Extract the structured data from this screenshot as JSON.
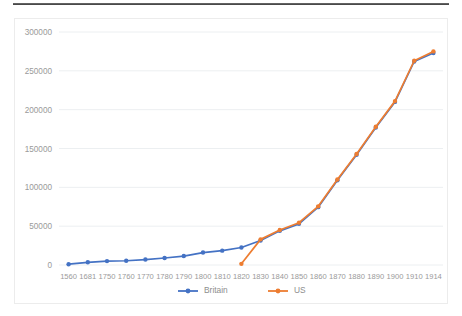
{
  "chart": {
    "title": "",
    "axis_color": "#9a9a9a",
    "grid_color": "#eceff1",
    "border_color": "#ececec"
  },
  "legend": {
    "position": "bottom",
    "entries": [
      {
        "label": "Britain",
        "color": "#4472C4",
        "marker": "circle"
      },
      {
        "label": "US",
        "color": "#ED7D31",
        "marker": "circle"
      }
    ]
  },
  "chart_data": {
    "type": "line",
    "title": "",
    "xlabel": "",
    "ylabel": "",
    "ylim": [
      0,
      300000
    ],
    "grid": true,
    "legend_position": "bottom",
    "categories": [
      "1560",
      "1681",
      "1750",
      "1760",
      "1770",
      "1780",
      "1790",
      "1800",
      "1810",
      "1820",
      "1830",
      "1840",
      "1850",
      "1860",
      "1870",
      "1880",
      "1890",
      "1900",
      "1910",
      "1914"
    ],
    "ytick_labels": [
      "0",
      "50000",
      "100000",
      "150000",
      "200000",
      "250000",
      "300000"
    ],
    "ytick_values": [
      0,
      50000,
      100000,
      150000,
      200000,
      250000,
      300000
    ],
    "series": [
      {
        "name": "Britain",
        "color": "#4472C4",
        "values": [
          1000,
          3500,
          5000,
          5500,
          7000,
          9000,
          11500,
          16000,
          18500,
          22500,
          31500,
          44000,
          53000,
          74500,
          109000,
          142000,
          177000,
          210000,
          262000,
          273000
        ]
      },
      {
        "name": "US",
        "color": "#ED7D31",
        "values": [
          null,
          null,
          null,
          null,
          null,
          null,
          null,
          null,
          null,
          1500,
          33000,
          45000,
          54500,
          75500,
          110000,
          143000,
          178000,
          211000,
          263000,
          275000
        ]
      }
    ]
  }
}
